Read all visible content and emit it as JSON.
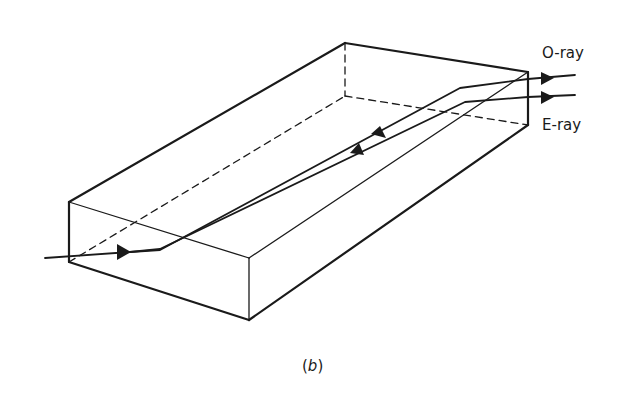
{
  "figure": {
    "caption_open": "(",
    "caption_letter": "b",
    "caption_close": ")",
    "labels": {
      "o_ray": "O-ray",
      "e_ray": "E-ray"
    },
    "colors": {
      "ink": "#1a1a1a",
      "background": "#ffffff"
    }
  }
}
